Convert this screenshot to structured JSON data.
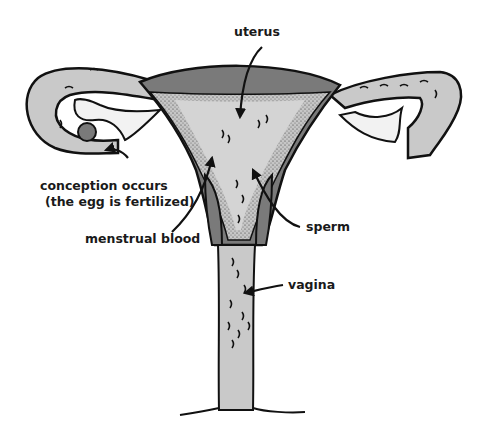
{
  "diagram": {
    "colors": {
      "outline": "#111111",
      "wall_dark": "#7a7a7a",
      "tube_light": "#c9c9c9",
      "cavity_light": "#d4d4d4",
      "background": "#ffffff"
    },
    "labels": {
      "uterus": "uterus",
      "conception_line1": "conception occurs",
      "conception_line2": "(the egg is fertilized)",
      "menstrual_blood": "menstrual blood",
      "sperm": "sperm",
      "vagina": "vagina"
    }
  }
}
